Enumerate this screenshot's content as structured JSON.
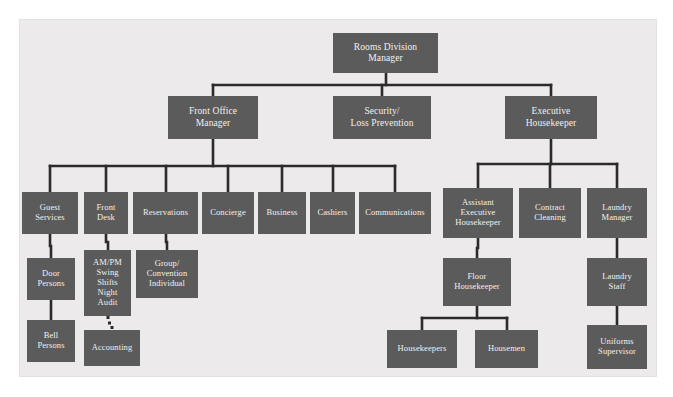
{
  "diagram": {
    "type": "organizational-chart",
    "colors": {
      "page_background": "#ffffff",
      "panel_background": "#eceaea",
      "node_fill": "#5b5b5b",
      "node_text": "#f2f0ee",
      "connector": "#2b2b2b"
    },
    "nodes": [
      {
        "id": "rooms_division_manager",
        "label": "Rooms Division\nManager",
        "x": 333,
        "y": 33,
        "w": 105,
        "h": 40,
        "font": 9.5,
        "level": 0
      },
      {
        "id": "front_office_manager",
        "label": "Front Office\nManager",
        "x": 168,
        "y": 96,
        "w": 90,
        "h": 43,
        "font": 9.5,
        "level": 1
      },
      {
        "id": "security_loss_prevention",
        "label": "Security/\nLoss Prevention",
        "x": 333,
        "y": 96,
        "w": 98,
        "h": 43,
        "font": 9.5,
        "level": 1
      },
      {
        "id": "executive_housekeeper",
        "label": "Executive\nHousekeeper",
        "x": 505,
        "y": 96,
        "w": 92,
        "h": 43,
        "font": 9.5,
        "level": 1
      },
      {
        "id": "guest_services",
        "label": "Guest\nServices",
        "x": 22,
        "y": 192,
        "w": 56,
        "h": 42,
        "font": 8.5,
        "level": 2
      },
      {
        "id": "front_desk",
        "label": "Front\nDesk",
        "x": 84,
        "y": 192,
        "w": 44,
        "h": 42,
        "font": 8.5,
        "level": 2
      },
      {
        "id": "reservations",
        "label": "Reservations",
        "x": 133,
        "y": 192,
        "w": 65,
        "h": 42,
        "font": 8.5,
        "level": 2
      },
      {
        "id": "concierge",
        "label": "Concierge",
        "x": 202,
        "y": 192,
        "w": 52,
        "h": 42,
        "font": 8.5,
        "level": 2
      },
      {
        "id": "business",
        "label": "Business",
        "x": 258,
        "y": 192,
        "w": 48,
        "h": 42,
        "font": 8.5,
        "level": 2
      },
      {
        "id": "cashiers",
        "label": "Cashiers",
        "x": 310,
        "y": 192,
        "w": 45,
        "h": 42,
        "font": 8.5,
        "level": 2
      },
      {
        "id": "communications",
        "label": "Communications",
        "x": 359,
        "y": 192,
        "w": 72,
        "h": 42,
        "font": 8.5,
        "level": 2
      },
      {
        "id": "assistant_executive_housekeeper",
        "label": "Assistant\nExecutive\nHousekeeper",
        "x": 443,
        "y": 188,
        "w": 70,
        "h": 50,
        "font": 8.5,
        "level": 2
      },
      {
        "id": "contract_cleaning",
        "label": "Contract\nCleaning",
        "x": 519,
        "y": 188,
        "w": 62,
        "h": 50,
        "font": 8.5,
        "level": 2
      },
      {
        "id": "laundry_manager",
        "label": "Laundry\nManager",
        "x": 587,
        "y": 188,
        "w": 60,
        "h": 50,
        "font": 8.5,
        "level": 2
      },
      {
        "id": "door_persons",
        "label": "Door\nPersons",
        "x": 27,
        "y": 258,
        "w": 48,
        "h": 42,
        "font": 8.5,
        "level": 3
      },
      {
        "id": "am_pm_swing_shifts_night_audit",
        "label": "AM/PM\nSwing\nShifts\nNight\nAudit",
        "x": 84,
        "y": 250,
        "w": 47,
        "h": 66,
        "font": 8.5,
        "level": 3
      },
      {
        "id": "group_convention_individual",
        "label": "Group/\nConvention\nIndividual",
        "x": 136,
        "y": 250,
        "w": 62,
        "h": 48,
        "font": 8.5,
        "level": 3
      },
      {
        "id": "floor_housekeeper",
        "label": "Floor\nHousekeeper",
        "x": 443,
        "y": 258,
        "w": 68,
        "h": 48,
        "font": 8.5,
        "level": 3
      },
      {
        "id": "laundry_staff",
        "label": "Laundry\nStaff",
        "x": 587,
        "y": 258,
        "w": 60,
        "h": 48,
        "font": 8.5,
        "level": 3
      },
      {
        "id": "bell_persons",
        "label": "Bell\nPersons",
        "x": 27,
        "y": 320,
        "w": 48,
        "h": 42,
        "font": 8.5,
        "level": 4
      },
      {
        "id": "accounting",
        "label": "Accounting",
        "x": 84,
        "y": 330,
        "w": 56,
        "h": 36,
        "font": 8.5,
        "level": 4
      },
      {
        "id": "housekeepers",
        "label": "Housekeepers",
        "x": 387,
        "y": 330,
        "w": 70,
        "h": 38,
        "font": 8.5,
        "level": 4
      },
      {
        "id": "housemen",
        "label": "Housemen",
        "x": 475,
        "y": 330,
        "w": 63,
        "h": 38,
        "font": 8.5,
        "level": 4
      },
      {
        "id": "uniforms_supervisor",
        "label": "Uniforms\nSupervisor",
        "x": 587,
        "y": 325,
        "w": 60,
        "h": 44,
        "font": 8.5,
        "level": 4
      }
    ],
    "edges": [
      {
        "from": "rooms_division_manager",
        "to": "front_office_manager",
        "style": "solid"
      },
      {
        "from": "rooms_division_manager",
        "to": "security_loss_prevention",
        "style": "solid"
      },
      {
        "from": "rooms_division_manager",
        "to": "executive_housekeeper",
        "style": "solid"
      },
      {
        "from": "front_office_manager",
        "to": "guest_services",
        "style": "solid"
      },
      {
        "from": "front_office_manager",
        "to": "front_desk",
        "style": "solid"
      },
      {
        "from": "front_office_manager",
        "to": "reservations",
        "style": "solid"
      },
      {
        "from": "front_office_manager",
        "to": "concierge",
        "style": "solid"
      },
      {
        "from": "front_office_manager",
        "to": "business",
        "style": "solid"
      },
      {
        "from": "front_office_manager",
        "to": "cashiers",
        "style": "solid"
      },
      {
        "from": "front_office_manager",
        "to": "communications",
        "style": "solid"
      },
      {
        "from": "executive_housekeeper",
        "to": "assistant_executive_housekeeper",
        "style": "solid"
      },
      {
        "from": "executive_housekeeper",
        "to": "contract_cleaning",
        "style": "solid"
      },
      {
        "from": "executive_housekeeper",
        "to": "laundry_manager",
        "style": "solid"
      },
      {
        "from": "guest_services",
        "to": "door_persons",
        "style": "solid"
      },
      {
        "from": "door_persons",
        "to": "bell_persons",
        "style": "solid"
      },
      {
        "from": "front_desk",
        "to": "am_pm_swing_shifts_night_audit",
        "style": "solid"
      },
      {
        "from": "reservations",
        "to": "group_convention_individual",
        "style": "solid"
      },
      {
        "from": "am_pm_swing_shifts_night_audit",
        "to": "accounting",
        "style": "dotted"
      },
      {
        "from": "assistant_executive_housekeeper",
        "to": "floor_housekeeper",
        "style": "solid"
      },
      {
        "from": "floor_housekeeper",
        "to": "housekeepers",
        "style": "solid"
      },
      {
        "from": "floor_housekeeper",
        "to": "housemen",
        "style": "solid"
      },
      {
        "from": "laundry_manager",
        "to": "laundry_staff",
        "style": "solid"
      },
      {
        "from": "laundry_staff",
        "to": "uniforms_supervisor",
        "style": "solid"
      }
    ]
  }
}
